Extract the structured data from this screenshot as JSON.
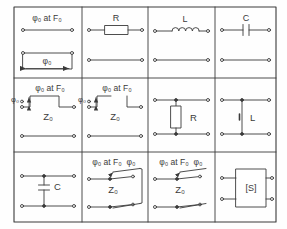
{
  "figure": {
    "type": "schematic-symbol-table",
    "grid": {
      "columns": 4,
      "rows": 3
    },
    "stroke_color": "#3a3a3a",
    "background_color": "#fefefe",
    "frame": {
      "x": 14,
      "y": 7,
      "width": 262,
      "height": 215
    },
    "column_edges": [
      14,
      82,
      148,
      215,
      276
    ],
    "row_edges": [
      7,
      78,
      152,
      222
    ]
  },
  "cells": [
    {
      "id": "r1c1",
      "name": "transmission-line-phase-reference",
      "symbol": "two-port transmission line with phase length annotation",
      "labels": {
        "top": "φ₀ at F₀",
        "inner": "φ₀"
      }
    },
    {
      "id": "r1c2",
      "name": "series-resistor",
      "symbol": "series resistor in two-port line",
      "labels": {
        "component": "R"
      }
    },
    {
      "id": "r1c3",
      "name": "series-inductor",
      "symbol": "series inductor coil in two-port line",
      "labels": {
        "component": "L"
      }
    },
    {
      "id": "r1c4",
      "name": "series-capacitor",
      "symbol": "series capacitor in two-port line",
      "labels": {
        "component": "C"
      }
    },
    {
      "id": "r2c1",
      "name": "loaded-line-phase-shifter-shorted",
      "symbol": "stepped impedance line section with phase taper, shorted stub",
      "labels": {
        "top": "φ₀ at F₀",
        "left": "φ₀",
        "impedance": "Z₀"
      }
    },
    {
      "id": "r2c2",
      "name": "loaded-line-phase-shifter-open",
      "symbol": "stepped impedance line section with phase taper, open end",
      "labels": {
        "top": "φ₀ at F₀",
        "left": "φ₀",
        "impedance": "Z₀"
      }
    },
    {
      "id": "r2c3",
      "name": "shunt-resistor",
      "symbol": "shunt resistor between two lines",
      "labels": {
        "component": "R"
      }
    },
    {
      "id": "r2c4",
      "name": "shunt-inductor",
      "symbol": "shunt inductor between two lines",
      "labels": {
        "component": "L"
      }
    },
    {
      "id": "r3c1",
      "name": "shunt-capacitor",
      "symbol": "shunt capacitor between two lines",
      "labels": {
        "component": "C"
      }
    },
    {
      "id": "r3c2",
      "name": "switched-line-phase-shifter-closed",
      "symbol": "switched line phase shifter with two SPDT switches and return path",
      "labels": {
        "top": "φ₀ at F₀",
        "top_right": "φ₀",
        "impedance": "Z₀"
      }
    },
    {
      "id": "r3c3",
      "name": "switched-line-phase-shifter-open",
      "symbol": "switched line phase shifter with two SPDT switches, no return path",
      "labels": {
        "top": "φ₀ at F₀",
        "top_right": "φ₀",
        "impedance": "Z₀"
      }
    },
    {
      "id": "r3c4",
      "name": "s-matrix-four-port",
      "symbol": "four port black box described by scattering matrix",
      "labels": {
        "component": "[S]"
      }
    }
  ]
}
